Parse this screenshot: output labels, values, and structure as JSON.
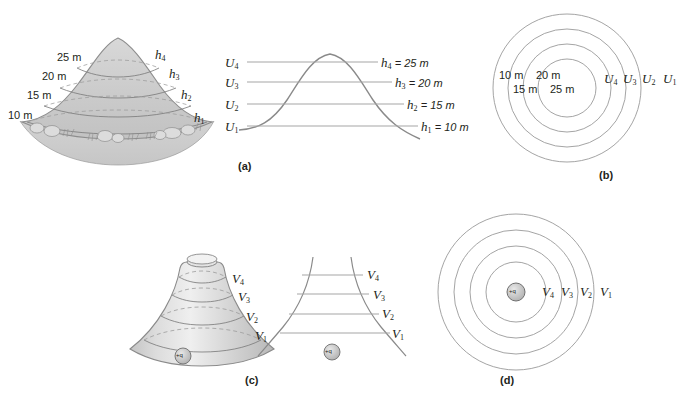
{
  "figure": {
    "background_color": "#ffffff",
    "ink_color": "#231f20",
    "line_color": "#8a8a8a",
    "fill_color": "#cfcfcf"
  },
  "panels": [
    {
      "id": "a-hill",
      "caption": "",
      "description": "pictorial hill with contour lines",
      "elevation_labels": [
        "25 m",
        "20 m",
        "15 m",
        "10 m"
      ],
      "slope_labels": [
        "h4",
        "h3",
        "h2",
        "h1"
      ],
      "slope_label_text": [
        "h",
        "h",
        "h",
        "h"
      ],
      "slope_label_subs": [
        "4",
        "3",
        "2",
        "1"
      ]
    },
    {
      "id": "a-profile",
      "caption": "(a)",
      "description": "hill cross-section with equipotential lines",
      "left_labels": [
        {
          "sym": "U",
          "sub": "4"
        },
        {
          "sym": "U",
          "sub": "3"
        },
        {
          "sym": "U",
          "sub": "2"
        },
        {
          "sym": "U",
          "sub": "1"
        }
      ],
      "right_labels": [
        {
          "sym": "h",
          "sub": "4",
          "value": "= 25 m"
        },
        {
          "sym": "h",
          "sub": "3",
          "value": "= 20 m"
        },
        {
          "sym": "h",
          "sub": "2",
          "value": "= 15 m"
        },
        {
          "sym": "h",
          "sub": "1",
          "value": "= 10 m"
        }
      ]
    },
    {
      "id": "b-contour-map",
      "caption": "(b)",
      "description": "top view concentric contour circles",
      "elevation_row_1": [
        "10 m",
        "20 m"
      ],
      "elevation_row_2": [
        "15 m",
        "25 m"
      ],
      "potential_labels": [
        {
          "sym": "U",
          "sub": "4"
        },
        {
          "sym": "U",
          "sub": "3"
        },
        {
          "sym": "U",
          "sub": "2"
        },
        {
          "sym": "U",
          "sub": "1"
        }
      ]
    },
    {
      "id": "c-funnel",
      "caption": "(c)",
      "description": "potential funnel around a point charge",
      "charge_label": "+q",
      "potential_labels": [
        {
          "sym": "V",
          "sub": "4"
        },
        {
          "sym": "V",
          "sub": "3"
        },
        {
          "sym": "V",
          "sub": "2"
        },
        {
          "sym": "V",
          "sub": "1"
        }
      ]
    },
    {
      "id": "c-profile",
      "caption": "",
      "description": "cross-section of potential funnel",
      "charge_label": "+q",
      "potential_labels": [
        {
          "sym": "V",
          "sub": "4"
        },
        {
          "sym": "V",
          "sub": "3"
        },
        {
          "sym": "V",
          "sub": "2"
        },
        {
          "sym": "V",
          "sub": "1"
        }
      ]
    },
    {
      "id": "d-equipotential-map",
      "caption": "(d)",
      "description": "top view concentric equipotential circles around point charge",
      "charge_label": "+q",
      "potential_labels": [
        {
          "sym": "V",
          "sub": "4"
        },
        {
          "sym": "V",
          "sub": "3"
        },
        {
          "sym": "V",
          "sub": "2"
        },
        {
          "sym": "V",
          "sub": "1"
        }
      ]
    }
  ],
  "captions": {
    "a": "(a)",
    "b": "(b)",
    "c": "(c)",
    "d": "(d)"
  },
  "hill_elevations": {
    "e25": "25 m",
    "e20": "20 m",
    "e15": "15 m",
    "e10": "10 m"
  },
  "map_b_elevations": {
    "r1c1": "10 m",
    "r1c2": "20 m",
    "r2c1": "15 m",
    "r2c2": "25 m"
  },
  "h_values": {
    "h4": "= 25 m",
    "h3": "= 20 m",
    "h2": "= 15 m",
    "h1": "= 10 m"
  },
  "charge": {
    "label": "+q"
  }
}
